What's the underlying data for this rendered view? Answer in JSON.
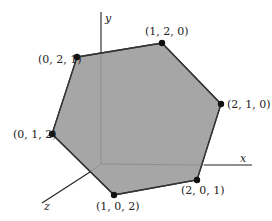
{
  "diagram": {
    "fill_color": "#a6a6a6",
    "edge_color": "#333333",
    "axes": [
      {
        "id": "x",
        "label": "x"
      },
      {
        "id": "y",
        "label": "y"
      },
      {
        "id": "z",
        "label": "z"
      }
    ],
    "vertices": [
      {
        "coords": [
          0,
          2,
          1
        ],
        "label": "(0, 2, 1)"
      },
      {
        "coords": [
          1,
          2,
          0
        ],
        "label": "(1, 2, 0)"
      },
      {
        "coords": [
          2,
          1,
          0
        ],
        "label": "(2, 1, 0)"
      },
      {
        "coords": [
          2,
          0,
          1
        ],
        "label": "(2, 0, 1)"
      },
      {
        "coords": [
          1,
          0,
          2
        ],
        "label": "(1, 0, 2)"
      },
      {
        "coords": [
          0,
          1,
          2
        ],
        "label": "(0, 1, 2)"
      }
    ]
  }
}
